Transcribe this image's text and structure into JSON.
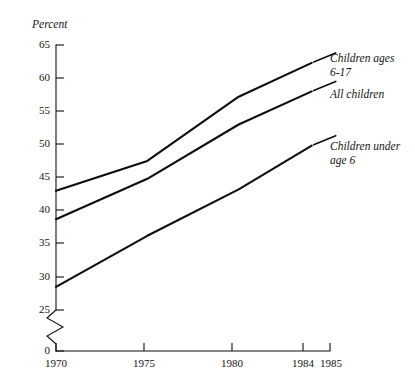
{
  "chart_data": {
    "type": "line",
    "title": "",
    "xlabel": "",
    "ylabel": "Percent",
    "xlim": [
      1970,
      1985
    ],
    "ylim": [
      25,
      65
    ],
    "y_axis_break": true,
    "y_axis_break_note": "axis broken between 0 and 25",
    "grid": false,
    "legend_position": "inline-right",
    "x": [
      1970,
      1975,
      1980,
      1984
    ],
    "xticks": [
      "1970",
      "1975",
      "1980",
      "1984",
      "1985"
    ],
    "xtick_values": [
      1970,
      1975,
      1980,
      1984,
      1985
    ],
    "yticks": [
      "0",
      "25",
      "30",
      "35",
      "40",
      "45",
      "50",
      "55",
      "60",
      "65"
    ],
    "ytick_values": [
      0,
      25,
      30,
      35,
      40,
      45,
      50,
      55,
      60,
      65
    ],
    "series": [
      {
        "name": "Children ages 6-17",
        "label_line1": "Children ages",
        "label_line2": "6-17",
        "values": [
          43.0,
          47.5,
          57.2,
          62.3
        ]
      },
      {
        "name": "All children",
        "label_line1": "All children",
        "label_line2": "",
        "values": [
          38.7,
          44.8,
          53.0,
          58.0
        ]
      },
      {
        "name": "Children under age 6",
        "label_line1": "Children under",
        "label_line2": "age 6",
        "values": [
          28.5,
          36.2,
          43.2,
          49.8
        ]
      }
    ]
  },
  "axis": {
    "y_title": "Percent",
    "ytick_labels": [
      "65",
      "60",
      "55",
      "50",
      "45",
      "40",
      "35",
      "30",
      "25",
      "0"
    ],
    "xtick_labels": [
      "1970",
      "1975",
      "1980",
      "1984",
      "1985"
    ]
  },
  "legend": {
    "items": [
      {
        "line1": "Children ages",
        "line2": "6-17"
      },
      {
        "line1": "All children",
        "line2": ""
      },
      {
        "line1": "Children under",
        "line2": "age 6"
      }
    ]
  },
  "colors": {
    "ink": "#111111",
    "background": "#ffffff"
  }
}
